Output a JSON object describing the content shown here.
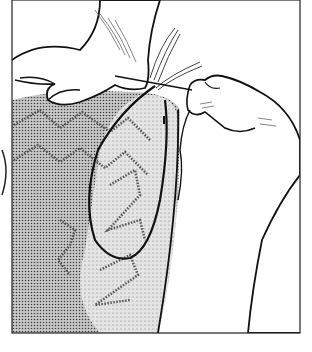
{
  "illustration": {
    "subject": "hands threading yarn through a needle into knitted zigzag-patterned fabric",
    "style": "black line drawing with stippled dot shading",
    "colors": {
      "background": "#ffffff",
      "ink": "#1a1a1a",
      "fabric_light": "#d9d9d9",
      "fabric_dark": "#a8a8a8",
      "frame": "#222222"
    }
  }
}
